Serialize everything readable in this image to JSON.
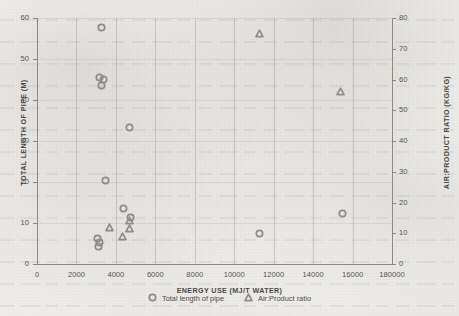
{
  "chart_data": {
    "type": "scatter",
    "title": "",
    "xlabel": "ENERGY USE (MJ/T WATER)",
    "ylabel_left": "TOTAL LENGTH OF PIPE (M)",
    "ylabel_right": "AIR:PRODUCT RATIO (KG/KG)",
    "xlim": [
      0,
      18000
    ],
    "ylim_left": [
      0,
      60
    ],
    "ylim_right": [
      0,
      80
    ],
    "grid": "vertical",
    "legend_position": "bottom-center",
    "xticks": [
      "0",
      "2000",
      "4000",
      "6000",
      "8000",
      "10000",
      "12000",
      "14000",
      "16000",
      "180000"
    ],
    "xtick_values": [
      0,
      2000,
      4000,
      6000,
      8000,
      10000,
      12000,
      14000,
      16000,
      18000
    ],
    "yticks_left": [
      "0",
      "10",
      "20",
      "30",
      "40",
      "50",
      "60"
    ],
    "ytick_left_values": [
      0,
      10,
      20,
      30,
      40,
      50,
      60
    ],
    "yticks_right": [
      "0",
      "10",
      "20",
      "30",
      "40",
      "50",
      "60",
      "70",
      "80"
    ],
    "ytick_right_values": [
      0,
      10,
      20,
      30,
      40,
      50,
      60,
      70,
      80
    ],
    "marker_color": "#8d8c88",
    "series": [
      {
        "name": "Total length of pipe",
        "marker": "circle",
        "axis": "left",
        "points": [
          {
            "x": 3250,
            "y": 57.8
          },
          {
            "x": 3150,
            "y": 45.6
          },
          {
            "x": 3350,
            "y": 45.0
          },
          {
            "x": 3250,
            "y": 43.6
          },
          {
            "x": 4700,
            "y": 33.2
          },
          {
            "x": 3450,
            "y": 20.4
          },
          {
            "x": 4400,
            "y": 13.6
          },
          {
            "x": 4750,
            "y": 11.4
          },
          {
            "x": 3050,
            "y": 6.2
          },
          {
            "x": 3150,
            "y": 5.2
          },
          {
            "x": 3100,
            "y": 4.2
          },
          {
            "x": 11300,
            "y": 7.4
          },
          {
            "x": 15500,
            "y": 12.4
          }
        ]
      },
      {
        "name": "Air:Product ratio",
        "marker": "triangle",
        "axis": "right",
        "points": [
          {
            "x": 3700,
            "y": 11.8
          },
          {
            "x": 4350,
            "y": 9.0
          },
          {
            "x": 4700,
            "y": 14.0
          },
          {
            "x": 4700,
            "y": 11.6
          },
          {
            "x": 11300,
            "y": 75.0
          },
          {
            "x": 15400,
            "y": 56.0
          }
        ]
      }
    ]
  },
  "legend": {
    "items": [
      {
        "label": "Total length of pipe",
        "marker": "circle"
      },
      {
        "label": "Air:Product ratio",
        "marker": "triangle"
      }
    ]
  }
}
